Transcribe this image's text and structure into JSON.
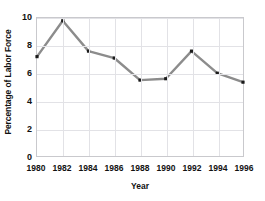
{
  "chart_data": {
    "type": "line",
    "title": "",
    "xlabel": "Year",
    "ylabel": "Percentage of Labor Force",
    "categories": [
      1980,
      1982,
      1984,
      1986,
      1988,
      1990,
      1992,
      1994,
      1996
    ],
    "x": [
      1980,
      1982,
      1984,
      1986,
      1988,
      1990,
      1992,
      1994,
      1996
    ],
    "values": [
      7.2,
      9.8,
      7.6,
      7.1,
      5.5,
      5.6,
      7.6,
      6.0,
      5.35
    ],
    "series": [
      {
        "name": "Percentage of Labor Force",
        "values": [
          7.2,
          9.8,
          7.6,
          7.1,
          5.5,
          5.6,
          7.6,
          6.0,
          5.35
        ]
      }
    ],
    "xlim": [
      1980,
      1996
    ],
    "ylim": [
      0,
      10
    ],
    "y_ticks": [
      0,
      2,
      4,
      6,
      8,
      10
    ],
    "y_tick_labels": [
      "0",
      "2",
      "4",
      "6",
      "8",
      "10"
    ],
    "x_ticks": [
      1980,
      1982,
      1984,
      1986,
      1988,
      1990,
      1992,
      1994,
      1996
    ],
    "x_tick_labels": [
      "1980",
      "1982",
      "1984",
      "1986",
      "1988",
      "1990",
      "1992",
      "1994",
      "1996"
    ],
    "grid": true,
    "legend": false,
    "legend_position": "none",
    "line_color": "#8c8c8c",
    "marker_color": "#1a1a1a",
    "grid_color": "#e2e2e6",
    "axis_color": "#c9c9cd",
    "text_color": "#111111",
    "background_color": "#ffffff"
  }
}
